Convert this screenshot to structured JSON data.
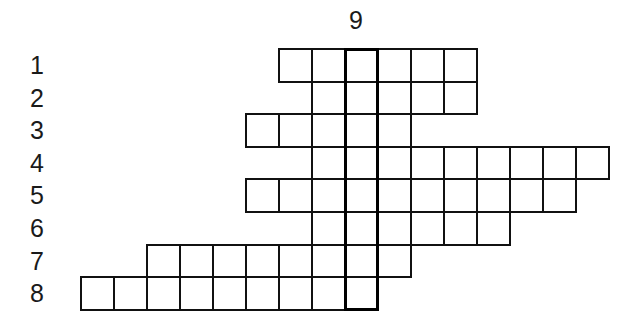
{
  "puzzle": {
    "type": "crossword-grid",
    "vertical_clue_label": "9",
    "highlight_column": 8,
    "row_labels": [
      "1",
      "2",
      "3",
      "4",
      "5",
      "6",
      "7",
      "8"
    ],
    "rows": [
      {
        "label": "1",
        "start_col": 6,
        "end_col": 11
      },
      {
        "label": "2",
        "start_col": 7,
        "end_col": 11
      },
      {
        "label": "3",
        "start_col": 5,
        "end_col": 9
      },
      {
        "label": "4",
        "start_col": 7,
        "end_col": 15
      },
      {
        "label": "5",
        "start_col": 5,
        "end_col": 14
      },
      {
        "label": "6",
        "start_col": 7,
        "end_col": 12
      },
      {
        "label": "7",
        "start_col": 2,
        "end_col": 9
      },
      {
        "label": "8",
        "start_col": 0,
        "end_col": 8
      }
    ]
  },
  "colors": {
    "line": "#111111",
    "background": "#ffffff"
  }
}
